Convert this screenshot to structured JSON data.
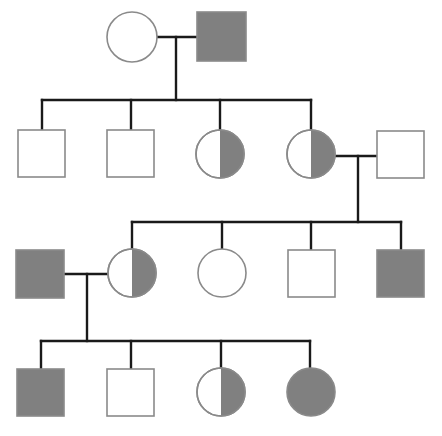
{
  "diagram": {
    "type": "pedigree",
    "width": 442,
    "height": 436,
    "background_color": "#ffffff",
    "legend": {
      "unaffected_label": "unaffected (open symbol)",
      "carrier_label": "carrier (half-shaded symbol)",
      "affected_label": "affected (fully shaded symbol)",
      "male_label": "male (square)",
      "female_label": "female (circle)"
    },
    "colors": {
      "shade_fill": "#808080",
      "symbol_stroke": "#8a8a8a",
      "line_color": "#1a1a1a",
      "open_fill": "#ffffff"
    },
    "style": {
      "symbol_stroke_width": 1.6,
      "line_width": 2.4
    },
    "generations": [
      {
        "id": "I",
        "label": "Generation I",
        "y_center": 37,
        "individuals": [
          {
            "id": "I-1",
            "sex": "female",
            "shape": "circle",
            "status": "unaffected",
            "fill": "none",
            "cx": 132,
            "cy": 37,
            "r": 25
          },
          {
            "id": "I-2",
            "sex": "male",
            "shape": "square",
            "status": "affected",
            "fill": "full",
            "x": 197,
            "y": 12,
            "size": 49
          }
        ]
      },
      {
        "id": "II",
        "label": "Generation II",
        "y_center": 154,
        "individuals": [
          {
            "id": "II-1",
            "sex": "male",
            "shape": "square",
            "status": "unaffected",
            "fill": "none",
            "x": 18,
            "y": 130,
            "size": 47
          },
          {
            "id": "II-2",
            "sex": "male",
            "shape": "square",
            "status": "unaffected",
            "fill": "none",
            "x": 107,
            "y": 130,
            "size": 47
          },
          {
            "id": "II-3",
            "sex": "female",
            "shape": "circle",
            "status": "carrier",
            "fill": "half-right",
            "cx": 220,
            "cy": 154,
            "r": 24
          },
          {
            "id": "II-4",
            "sex": "female",
            "shape": "circle",
            "status": "carrier",
            "fill": "half-right",
            "cx": 311,
            "cy": 154,
            "r": 24
          },
          {
            "id": "II-5",
            "sex": "male",
            "shape": "square",
            "status": "unaffected",
            "fill": "none",
            "x": 377,
            "y": 131,
            "size": 47
          }
        ]
      },
      {
        "id": "III",
        "label": "Generation III",
        "y_center": 273,
        "individuals": [
          {
            "id": "III-1",
            "sex": "male",
            "shape": "square",
            "status": "affected",
            "fill": "full",
            "x": 16,
            "y": 250,
            "size": 48
          },
          {
            "id": "III-2",
            "sex": "female",
            "shape": "circle",
            "status": "carrier",
            "fill": "half-right",
            "cx": 132,
            "cy": 273,
            "r": 24
          },
          {
            "id": "III-3",
            "sex": "female",
            "shape": "circle",
            "status": "unaffected",
            "fill": "none",
            "cx": 222,
            "cy": 273,
            "r": 24
          },
          {
            "id": "III-4",
            "sex": "male",
            "shape": "square",
            "status": "unaffected",
            "fill": "none",
            "x": 288,
            "y": 250,
            "size": 47
          },
          {
            "id": "III-5",
            "sex": "male",
            "shape": "square",
            "status": "affected",
            "fill": "full",
            "x": 377,
            "y": 250,
            "size": 47
          }
        ]
      },
      {
        "id": "IV",
        "label": "Generation IV",
        "y_center": 392,
        "individuals": [
          {
            "id": "IV-1",
            "sex": "male",
            "shape": "square",
            "status": "affected",
            "fill": "full",
            "x": 17,
            "y": 369,
            "size": 47
          },
          {
            "id": "IV-2",
            "sex": "male",
            "shape": "square",
            "status": "unaffected",
            "fill": "none",
            "x": 107,
            "y": 369,
            "size": 47
          },
          {
            "id": "IV-3",
            "sex": "female",
            "shape": "circle",
            "status": "carrier",
            "fill": "half-right",
            "cx": 221,
            "cy": 392,
            "r": 24
          },
          {
            "id": "IV-4",
            "sex": "female",
            "shape": "circle",
            "status": "affected",
            "fill": "full",
            "cx": 311,
            "cy": 392,
            "r": 24
          }
        ]
      }
    ],
    "matings": [
      {
        "id": "mating-I",
        "partners": [
          "I-1",
          "I-2"
        ],
        "line_y": 37,
        "line_x1": 157,
        "line_x2": 197,
        "descent_x": 176,
        "descent_y2": 100
      },
      {
        "id": "mating-II",
        "partners": [
          "II-4",
          "II-5"
        ],
        "line_y": 156,
        "line_x1": 335,
        "line_x2": 378,
        "descent_x": 358,
        "descent_y2": 222
      },
      {
        "id": "mating-III",
        "partners": [
          "III-1",
          "III-2"
        ],
        "line_y": 274,
        "line_x1": 64,
        "line_x2": 108,
        "descent_x": 87,
        "descent_y2": 341
      }
    ],
    "sibships": [
      {
        "id": "sibship-II",
        "bar_y": 100,
        "bar_x1": 42,
        "bar_x2": 311,
        "drops": [
          {
            "x": 42,
            "y2": 130
          },
          {
            "x": 131,
            "y2": 130
          },
          {
            "x": 220,
            "y2": 130
          },
          {
            "x": 311,
            "y2": 130
          }
        ]
      },
      {
        "id": "sibship-III",
        "bar_y": 222,
        "bar_x1": 132,
        "bar_x2": 401,
        "drops": [
          {
            "x": 132,
            "y2": 249
          },
          {
            "x": 222,
            "y2": 249
          },
          {
            "x": 311,
            "y2": 250
          },
          {
            "x": 401,
            "y2": 250
          }
        ]
      },
      {
        "id": "sibship-IV",
        "bar_y": 341,
        "bar_x1": 41,
        "bar_x2": 310,
        "drops": [
          {
            "x": 41,
            "y2": 369
          },
          {
            "x": 131,
            "y2": 369
          },
          {
            "x": 221,
            "y2": 368
          },
          {
            "x": 310,
            "y2": 368
          }
        ]
      }
    ]
  }
}
